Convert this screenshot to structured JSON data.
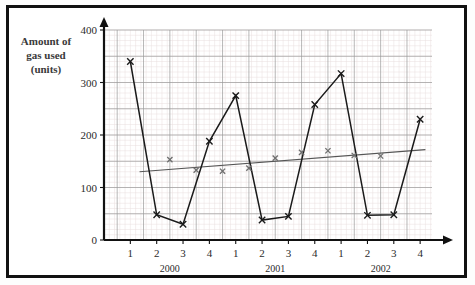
{
  "figure": {
    "background_color": "#ffffff",
    "border_color": "#111111"
  },
  "axis_titles": {
    "y_line1": "Amount of",
    "y_line2": "gas used",
    "y_line3": "(units)"
  },
  "chart_data": {
    "type": "line",
    "title": "",
    "subtitle": "",
    "xlabel": "",
    "ylabel": "Amount of gas used (units)",
    "ylim": [
      0,
      400
    ],
    "yticks": [
      0,
      100,
      200,
      300,
      400
    ],
    "ytick_labels": [
      "0",
      "100",
      "200",
      "300",
      "400"
    ],
    "grid": true,
    "grid_major_step": 50,
    "grid_minor_step": 10,
    "legend_position": "none",
    "categories": [
      "1",
      "2",
      "3",
      "4",
      "1",
      "2",
      "3",
      "4",
      "1",
      "2",
      "3",
      "4"
    ],
    "xtick_labels": [
      "1",
      "2",
      "3",
      "4",
      "1",
      "2",
      "3",
      "4",
      "1",
      "2",
      "3",
      "4"
    ],
    "group_labels": [
      "2000",
      "2001",
      "2002"
    ],
    "group_spans": [
      [
        0,
        3
      ],
      [
        4,
        7
      ],
      [
        8,
        11
      ]
    ],
    "series": [
      {
        "name": "Amount of gas used",
        "marker": "x",
        "color": "#1a1a1a",
        "x": [
          1,
          2,
          3,
          4,
          5,
          6,
          7,
          8,
          9,
          10,
          11,
          12
        ],
        "values": [
          340,
          48,
          30,
          188,
          275,
          38,
          45,
          258,
          317,
          47,
          48,
          230
        ]
      },
      {
        "name": "4-point moving average",
        "marker": "x",
        "color": "#6e6e6e",
        "line": false,
        "x": [
          2.5,
          3.5,
          4.5,
          5.5,
          6.5,
          7.5,
          8.5,
          9.5,
          10.5
        ],
        "values": [
          153,
          133,
          131,
          137,
          156,
          167,
          170,
          161,
          160
        ]
      }
    ],
    "trend_line": {
      "name": "trend line",
      "color": "#555555",
      "x_start": 1.35,
      "y_start": 130,
      "x_end": 12.2,
      "y_end": 172
    }
  }
}
